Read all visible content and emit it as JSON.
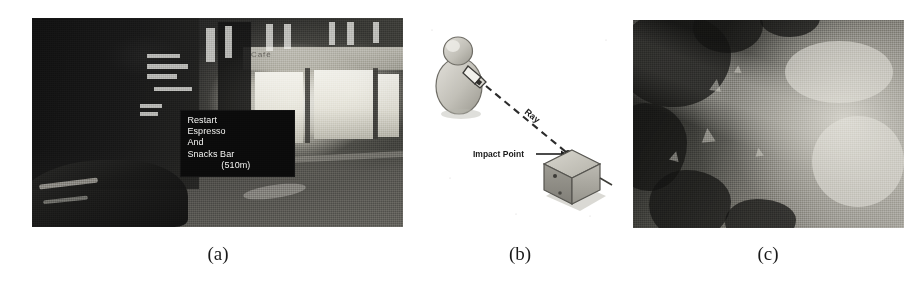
{
  "figure": {
    "panel_count": 3,
    "background_color": "#ffffff"
  },
  "panels": [
    {
      "id": "a",
      "caption": "(a)",
      "kind": "photograph",
      "description": "Night-time urban street scene with an augmented-reality text label overlaid on the view",
      "storefront_sign": "Café",
      "ar_overlay": {
        "lines": [
          "Restart",
          "Espresso",
          "And",
          "Snacks Bar",
          "(510m)"
        ],
        "distance": "510m",
        "text_color": "#f2f2f0",
        "background_color": "#0b0b0b"
      }
    },
    {
      "id": "b",
      "caption": "(b)",
      "kind": "diagram",
      "description": "Line diagram of a user pointing a hand-held device, casting a ray toward a cube",
      "labels": {
        "ray": "Ray",
        "impact_point": "Impact Point"
      },
      "line_color": "#2b2b2b",
      "fill_color": "#b8b6b0"
    },
    {
      "id": "c",
      "caption": "(c)",
      "kind": "photograph",
      "description": "Grainy grayscale aerial terrain image with small triangular markers"
    }
  ]
}
